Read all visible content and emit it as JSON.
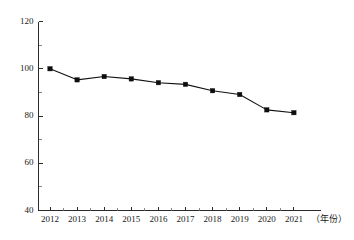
{
  "chart_data": {
    "type": "line",
    "title": "",
    "xlabel": "（年份）",
    "ylabel": "",
    "categories": [
      "2012",
      "2013",
      "2014",
      "2015",
      "2016",
      "2017",
      "2018",
      "2019",
      "2020",
      "2021"
    ],
    "x": [
      2012,
      2013,
      2014,
      2015,
      2016,
      2017,
      2018,
      2019,
      2020,
      2021
    ],
    "values": [
      100.0,
      95.3,
      96.7,
      95.7,
      94.1,
      93.4,
      90.7,
      89.1,
      82.6,
      81.4
    ],
    "series": [
      {
        "name": "",
        "values": [
          100.0,
          95.3,
          96.7,
          95.7,
          94.1,
          93.4,
          90.7,
          89.1,
          82.6,
          81.4
        ]
      }
    ],
    "ylim": [
      40,
      120
    ],
    "ytick_labels": [
      "40",
      "60",
      "80",
      "100",
      "120"
    ],
    "ytick_values": [
      40,
      60,
      80,
      100,
      120
    ],
    "yminor_values": [
      50,
      70,
      90,
      110
    ],
    "xtick_labels": [
      "2012",
      "2013",
      "2014",
      "2015",
      "2016",
      "2017",
      "2018",
      "2019",
      "2020",
      "2021"
    ],
    "grid": false,
    "legend": "none",
    "marker": "square",
    "line_color": "#111111",
    "marker_color": "#0d0d0d",
    "axis_color": "#2b2b2b",
    "background_color": "#ffffff",
    "annotations": []
  },
  "axis": {
    "x_caption": "（年份）",
    "y_caption": ""
  }
}
